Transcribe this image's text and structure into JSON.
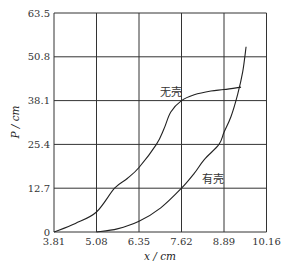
{
  "chart_data": {
    "type": "line",
    "title": "",
    "xlabel": "x / cm",
    "ylabel": "P / cm",
    "xlim": [
      3.81,
      10.16
    ],
    "ylim": [
      0,
      63.5
    ],
    "x_ticks": [
      "3.81",
      "5.08",
      "6.35",
      "7.62",
      "8.89",
      "10.16"
    ],
    "y_ticks": [
      "0",
      "12.7",
      "25.4",
      "38.1",
      "50.8",
      "63.5"
    ],
    "grid": true,
    "legend": "inline labels on curves",
    "series": [
      {
        "name": "无壳",
        "x": [
          3.81,
          4.45,
          5.08,
          5.62,
          6.0,
          6.35,
          6.87,
          7.1,
          7.3,
          7.62,
          8.0,
          8.5,
          8.89,
          9.4
        ],
        "y": [
          0,
          2.5,
          5.8,
          12.7,
          15.5,
          18.7,
          25.4,
          30.0,
          34.8,
          38.1,
          39.8,
          40.9,
          41.3,
          42.0
        ]
      },
      {
        "name": "有壳",
        "x": [
          5.08,
          5.7,
          6.35,
          7.0,
          7.62,
          8.0,
          8.3,
          8.74,
          8.89,
          9.1,
          9.3,
          9.45,
          9.55
        ],
        "y": [
          0,
          0.9,
          3.1,
          7.0,
          12.7,
          17.0,
          21.0,
          25.4,
          28.9,
          33.5,
          40.0,
          46.5,
          53.7
        ]
      }
    ],
    "annotations": [
      {
        "text": "无壳",
        "x": 7.3,
        "y": 40.5
      },
      {
        "text": "有壳",
        "x": 8.55,
        "y": 15.5
      }
    ]
  }
}
